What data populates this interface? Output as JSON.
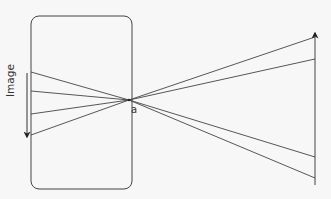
{
  "diagram": {
    "labels": {
      "image": "Image",
      "aperture": "a"
    },
    "colors": {
      "background": "#f7f7f7",
      "stroke": "#444444"
    },
    "camera_box": {
      "x": 31,
      "y": 16,
      "width": 101,
      "height": 173,
      "rx": 8
    },
    "aperture_point": {
      "x": 129,
      "y": 100
    },
    "image_arrow": {
      "x": 27,
      "y_start": 73,
      "y_end": 137,
      "direction": "down"
    },
    "object_arrow": {
      "x": 315,
      "y_start": 185,
      "y_end": 33,
      "direction": "up"
    },
    "rays": [
      {
        "left": [
          31,
          72
        ],
        "right": [
          315,
          37
        ]
      },
      {
        "left": [
          31,
          91
        ],
        "right": [
          315,
          59
        ]
      },
      {
        "left": [
          31,
          114
        ],
        "right": [
          315,
          157
        ]
      },
      {
        "left": [
          31,
          135
        ],
        "right": [
          315,
          178
        ]
      }
    ]
  }
}
